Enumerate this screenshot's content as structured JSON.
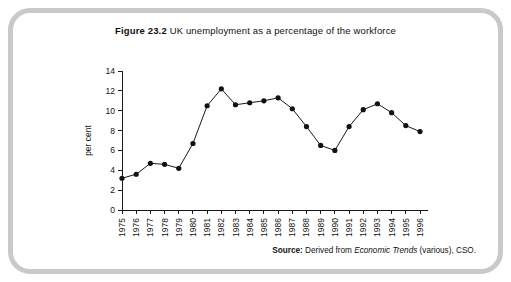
{
  "figure": {
    "label": "Figure 23.2",
    "caption": "UK unemployment as a percentage of the workforce"
  },
  "source": {
    "label": "Source:",
    "text_before": "Derived from",
    "italic_text": "Economic Trends",
    "text_after": "(various), CSO."
  },
  "colors": {
    "frame": "#c9c9c9",
    "background": "#ffffff",
    "line": "#1a1a1a",
    "marker": "#111111",
    "text": "#111111"
  },
  "chart_data": {
    "type": "line",
    "title": "UK unemployment as a percentage of the workforce",
    "xlabel": "",
    "ylabel": "per cent",
    "categories": [
      "1975",
      "1976",
      "1977",
      "1978",
      "1979",
      "1980",
      "1981",
      "1982",
      "1983",
      "1984",
      "1985",
      "1986",
      "1987",
      "1988",
      "1989",
      "1990",
      "1991",
      "1992",
      "1993",
      "1994",
      "1995",
      "1996"
    ],
    "values": [
      3.2,
      3.6,
      4.7,
      4.6,
      4.2,
      6.7,
      10.5,
      12.2,
      10.6,
      10.8,
      11.0,
      11.3,
      10.2,
      8.4,
      6.5,
      6.0,
      8.4,
      10.1,
      10.7,
      9.8,
      8.5,
      7.9
    ],
    "ylim": [
      0,
      14
    ],
    "yticks": [
      0,
      2,
      4,
      6,
      8,
      10,
      12,
      14
    ],
    "xtick_rotation": -90,
    "grid": false,
    "legend": false,
    "marker": "circle",
    "series": [
      {
        "name": "UK unemployment rate",
        "values": [
          3.2,
          3.6,
          4.7,
          4.6,
          4.2,
          6.7,
          10.5,
          12.2,
          10.6,
          10.8,
          11.0,
          11.3,
          10.2,
          8.4,
          6.5,
          6.0,
          8.4,
          10.1,
          10.7,
          9.8,
          8.5,
          7.9
        ]
      }
    ]
  }
}
